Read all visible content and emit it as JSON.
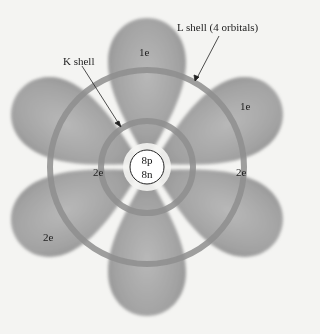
{
  "diagram": {
    "type": "atomic-orbital-model",
    "nucleus": {
      "protons": "8p",
      "neutrons": "8n"
    },
    "labels": {
      "k_shell": "K shell",
      "l_shell": "L shell (4 orbitals)"
    },
    "orbital_electrons": [
      {
        "position": "top",
        "label": "1e"
      },
      {
        "position": "upper-right",
        "label": "1e"
      },
      {
        "position": "right-inner",
        "label": "2e"
      },
      {
        "position": "left-inner",
        "label": "2e"
      },
      {
        "position": "lower-left",
        "label": "2e"
      }
    ],
    "colors": {
      "background": "#f4f4f2",
      "lobe": "#9a9a9a",
      "shell_ring": "#8e8e8e",
      "nucleus_fill": "#ffffff",
      "text": "#222222"
    }
  }
}
